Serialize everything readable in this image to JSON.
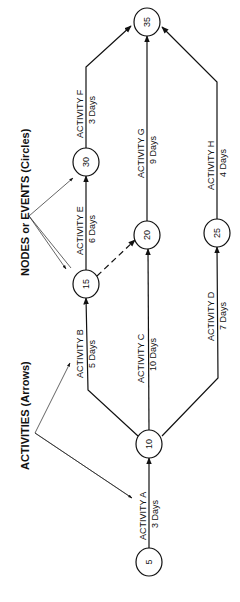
{
  "labels": {
    "activities_legend": "ACTIVITIES  (Arrows)",
    "nodes_legend": "NODES or EVENTS (Circles)"
  },
  "nodes": [
    {
      "id": "5",
      "label": "5",
      "cx": 149,
      "cy": 562
    },
    {
      "id": "10",
      "label": "10",
      "cx": 149,
      "cy": 444
    },
    {
      "id": "15",
      "label": "15",
      "cx": 86,
      "cy": 284
    },
    {
      "id": "20",
      "label": "20",
      "cx": 147,
      "cy": 235
    },
    {
      "id": "25",
      "label": "25",
      "cx": 217,
      "cy": 233
    },
    {
      "id": "30",
      "label": "30",
      "cx": 86,
      "cy": 162
    },
    {
      "id": "35",
      "label": "35",
      "cx": 147,
      "cy": 22
    }
  ],
  "activities": [
    {
      "name": "ACTIVITY  A",
      "duration": "3 Days",
      "from": "5",
      "to": "10"
    },
    {
      "name": "ACTIVITY  B",
      "duration": "5 Days",
      "from": "10",
      "to": "15"
    },
    {
      "name": "ACTIVITY  C",
      "duration": "10 Days",
      "from": "10",
      "to": "20"
    },
    {
      "name": "ACTIVITY  D",
      "duration": "7 Days",
      "from": "10",
      "to": "25"
    },
    {
      "name": "ACTIVITY  E",
      "duration": "6 Days",
      "from": "15",
      "to": "30"
    },
    {
      "name": "ACTIVITY  F",
      "duration": "3 Days",
      "from": "30",
      "to": "35"
    },
    {
      "name": "ACTIVITY  G",
      "duration": "9 Days",
      "from": "20",
      "to": "35"
    },
    {
      "name": "ACTIVITY  H",
      "duration": "4 Days",
      "from": "25",
      "to": "35"
    }
  ],
  "dummy_activities": [
    {
      "from": "15",
      "to": "20",
      "style": "dashed"
    }
  ]
}
